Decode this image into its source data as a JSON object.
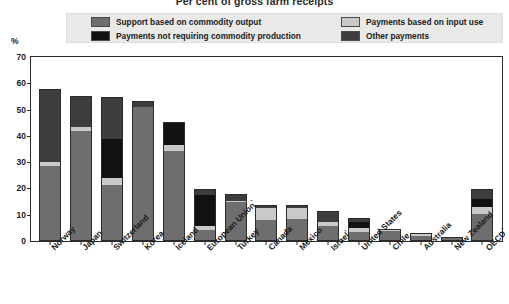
{
  "title": "Per cent of gross farm receipts",
  "axis": {
    "ylabel": "%",
    "yticks": [
      "0",
      "10",
      "20",
      "30",
      "40",
      "50",
      "60",
      "70"
    ],
    "ymin": 0,
    "ymax": 70
  },
  "legend": {
    "items": [
      {
        "label": "Support based on commodity output",
        "color": "#6e6e6e"
      },
      {
        "label": "Payments based on input use",
        "color": "#c9c9c9"
      },
      {
        "label": "Payments not requiring commodity production",
        "color": "#111111"
      },
      {
        "label": "Other payments",
        "color": "#3d3d3d"
      }
    ]
  },
  "chart_data": {
    "type": "bar",
    "stacked": true,
    "title": "Per cent of gross farm receipts",
    "xlabel": "",
    "ylabel": "%",
    "ylim": [
      0,
      70
    ],
    "grid": false,
    "legend_position": "top",
    "categories": [
      "Norway",
      "Japan",
      "Switzerland",
      "Korea",
      "Iceland",
      "European Union¹",
      "Turkey",
      "Canada",
      "Mexico",
      "Israel²",
      "United States",
      "Chile",
      "Australia",
      "New Zealand",
      "OECD³"
    ],
    "series": [
      {
        "name": "Support based on commodity output",
        "color": "#6e6e6e",
        "values": [
          28.0,
          41.5,
          21.0,
          50.5,
          34.0,
          4.0,
          14.5,
          7.5,
          8.0,
          5.5,
          3.0,
          3.5,
          1.5,
          0.7,
          10.0
        ]
      },
      {
        "name": "Payments based on input use",
        "color": "#c9c9c9",
        "values": [
          1.5,
          1.5,
          2.5,
          0.0,
          2.0,
          1.5,
          0.5,
          4.5,
          4.0,
          1.5,
          1.5,
          0.5,
          0.7,
          0.2,
          2.5
        ]
      },
      {
        "name": "Payments not requiring commodity production",
        "color": "#111111",
        "values": [
          0.0,
          0.0,
          15.0,
          0.0,
          8.5,
          11.5,
          0.0,
          0.0,
          0.0,
          0.0,
          2.5,
          0.0,
          0.0,
          0.0,
          3.0
        ]
      },
      {
        "name": "Other payments",
        "color": "#3d3d3d",
        "values": [
          27.5,
          11.5,
          15.5,
          2.0,
          0.0,
          2.0,
          2.0,
          1.0,
          1.0,
          3.5,
          1.0,
          0.0,
          0.0,
          0.0,
          3.5
        ]
      }
    ],
    "totals": [
      57.0,
      54.5,
      54.0,
      52.5,
      44.5,
      19.0,
      17.0,
      13.0,
      13.0,
      10.5,
      8.0,
      4.0,
      2.2,
      0.9,
      19.0
    ]
  }
}
